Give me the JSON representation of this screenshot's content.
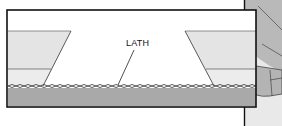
{
  "diagram": {
    "labels": {
      "lath": "LATH"
    },
    "colors": {
      "background": "#ffffff",
      "frame": "#111111",
      "light_panel": "#e4e4e4",
      "lower_panel": "#ececec",
      "base_band": "#a9a9a9",
      "side_illustration": "#c8c8c8",
      "lath_fill": "#f2f2f2"
    }
  }
}
